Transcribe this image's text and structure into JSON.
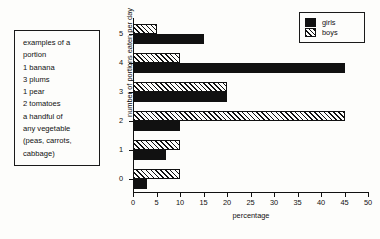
{
  "info_box": {
    "lines": [
      "examples of a",
      "portion",
      "1 banana",
      "3 plums",
      "1 pear",
      "2 tomatoes",
      "a handful of",
      "any vegetable",
      "(peas, carrots,",
      "cabbage)"
    ]
  },
  "legend": {
    "position": "top-right",
    "entries": [
      {
        "label": "girls",
        "swatch": "solid-black"
      },
      {
        "label": "boys",
        "swatch": "diagonal-hatch"
      }
    ]
  },
  "chart_data": {
    "type": "bar",
    "orientation": "horizontal",
    "title": "",
    "xlabel": "percentage",
    "ylabel": "number of portions eaten per day",
    "categories": [
      "0",
      "1",
      "2",
      "3",
      "4",
      "5"
    ],
    "series": [
      {
        "name": "girls",
        "values": [
          3,
          7,
          10,
          20,
          45,
          15
        ],
        "color": "#111111",
        "fill": "solid"
      },
      {
        "name": "boys",
        "values": [
          10,
          10,
          45,
          20,
          10,
          5
        ],
        "color": "#111111",
        "fill": "hatch"
      }
    ],
    "xlim": [
      0,
      50
    ],
    "xticks": [
      0,
      5,
      10,
      15,
      20,
      25,
      30,
      35,
      40,
      45,
      50
    ],
    "yticks": [
      "0",
      "1",
      "2",
      "3",
      "4",
      "5"
    ],
    "grid": false,
    "legend_position": "top-right"
  }
}
